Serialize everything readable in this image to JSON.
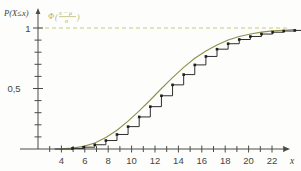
{
  "chart_data": {
    "type": "line",
    "title": "",
    "subtitle": "",
    "xlabel": "x",
    "ylabel": "P(X≤x)",
    "xlim": [
      2.6,
      25.8
    ],
    "ylim": [
      0,
      1.12
    ],
    "grid": false,
    "legend_position": "inside-top-left",
    "annotations": [
      {
        "name": "normal-approximation-label",
        "text_full": "Φ((x−μ)/σ)",
        "phi": "Φ",
        "open_paren": "(",
        "numerator": "x − μ",
        "denominator": "σ",
        "close_paren": ")",
        "color": "#b3b36a",
        "x": 11.5,
        "y": 1.09
      },
      {
        "name": "asymptote-line",
        "text": "",
        "y": 1,
        "color": "#c9c97e",
        "style": "dashed"
      }
    ],
    "x_ticks_major": [
      4,
      6,
      8,
      10,
      12,
      14,
      16,
      18,
      20,
      22,
      24
    ],
    "x_tick_labels": [
      "4",
      "6",
      "8",
      "10",
      "12",
      "14",
      "16",
      "18",
      "20",
      "22",
      "24"
    ],
    "x_ticks_minor": [
      3,
      5,
      7,
      9,
      11,
      13,
      15,
      17,
      19,
      21,
      23,
      25
    ],
    "y_ticks_major": [
      0.5,
      1
    ],
    "y_tick_labels": [
      "0,5",
      "1"
    ],
    "y_ticks_minor": [
      0.1,
      0.2,
      0.3,
      0.4,
      0.6,
      0.7,
      0.8,
      0.9
    ],
    "series": [
      {
        "name": "Empirical CDF (step function)",
        "type": "step",
        "color": "#2e2e2c",
        "marker": "square",
        "x": [
          4,
          5,
          6,
          7,
          8,
          9,
          10,
          11,
          12,
          13,
          14,
          15,
          16,
          17,
          18,
          19,
          20,
          21,
          22,
          23,
          24,
          25
        ],
        "values": [
          0.0,
          0.005,
          0.015,
          0.035,
          0.07,
          0.12,
          0.185,
          0.265,
          0.35,
          0.44,
          0.53,
          0.615,
          0.695,
          0.765,
          0.825,
          0.87,
          0.905,
          0.93,
          0.95,
          0.965,
          0.975,
          0.98
        ]
      },
      {
        "name": "Normal approximation Φ((x−μ)/σ)",
        "type": "line",
        "color": "#8f8f4e",
        "marker": "none",
        "x": [
          4,
          5,
          6,
          7,
          8,
          9,
          10,
          11,
          12,
          13,
          14,
          15,
          16,
          17,
          18,
          19,
          20,
          21,
          22,
          23,
          24,
          25
        ],
        "values": [
          0.002,
          0.008,
          0.022,
          0.05,
          0.095,
          0.155,
          0.23,
          0.315,
          0.405,
          0.5,
          0.59,
          0.675,
          0.75,
          0.81,
          0.86,
          0.9,
          0.93,
          0.95,
          0.966,
          0.976,
          0.982,
          0.987
        ]
      }
    ],
    "params": {
      "mu": 14,
      "sigma": 4.2
    }
  },
  "axes": {
    "y_axis_label": "P(X≤x)",
    "x_axis_label": "x",
    "y_tick_1": "1",
    "y_tick_half": "0,5"
  }
}
